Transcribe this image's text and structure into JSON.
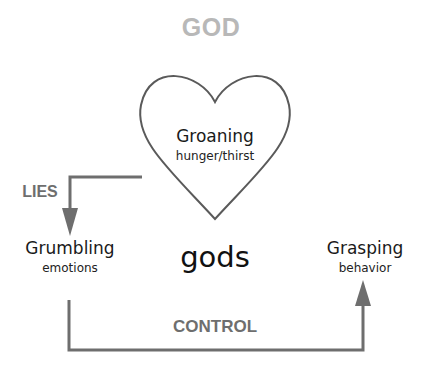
{
  "diagram": {
    "title": "GOD",
    "center_label": "gods",
    "nodes": [
      {
        "id": "groaning",
        "label": "Groaning",
        "sublabel": "hunger/thirst",
        "shape": "heart"
      },
      {
        "id": "grumbling",
        "label": "Grumbling",
        "sublabel": "emotions"
      },
      {
        "id": "grasping",
        "label": "Grasping",
        "sublabel": "behavior"
      }
    ],
    "edges": [
      {
        "from": "groaning",
        "to": "grumbling",
        "label": "LIES"
      },
      {
        "from": "grumbling",
        "to": "grasping",
        "label": "CONTROL"
      }
    ],
    "colors": {
      "title": "#b8b8b8",
      "edge": "#6e6e6e",
      "heart_outline": "#5a5a5a",
      "text": "#1a1a1a"
    }
  }
}
